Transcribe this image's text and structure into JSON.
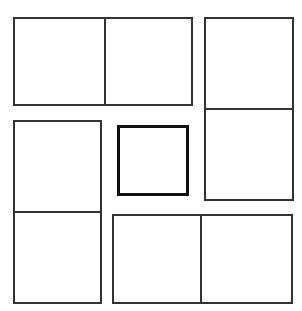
{
  "diagram": {
    "type": "pinwheel-rectangles",
    "canvas": {
      "width": 302,
      "height": 311,
      "background": "#ffffff"
    },
    "line_color": "#333333",
    "center_line_color": "#111111",
    "blocks": [
      {
        "id": "top",
        "x": 13,
        "y": 17,
        "w": 180,
        "h": 89,
        "split": "vertical",
        "divider_at": 91,
        "cells": 2
      },
      {
        "id": "right",
        "x": 204,
        "y": 17,
        "w": 90,
        "h": 184,
        "split": "horizontal",
        "divider_at": 91,
        "cells": 2
      },
      {
        "id": "left",
        "x": 13,
        "y": 120,
        "w": 89,
        "h": 184,
        "split": "horizontal",
        "divider_at": 91,
        "cells": 2
      },
      {
        "id": "bottom",
        "x": 112,
        "y": 214,
        "w": 181,
        "h": 90,
        "split": "vertical",
        "divider_at": 88,
        "cells": 2
      }
    ],
    "center_square": {
      "x": 117,
      "y": 125,
      "w": 72,
      "h": 71,
      "border_width": 3
    }
  }
}
